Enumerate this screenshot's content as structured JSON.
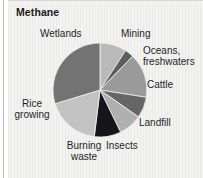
{
  "figure": {
    "title": "Methane",
    "background_color": "#f2f2f1"
  },
  "chart_data": {
    "type": "pie",
    "title": "Methane",
    "subtitle": "",
    "xlabel": "",
    "ylabel": "",
    "grid": false,
    "legend_position": "outside-labels",
    "units": "percent of methane emissions",
    "categories": [
      "Mining",
      "Oceans, freshwaters",
      "Cattle",
      "Landfill",
      "Insects",
      "Burning waste",
      "Rice growing",
      "Wetlands"
    ],
    "values": [
      9,
      3,
      15,
      7,
      8,
      9,
      18,
      31
    ],
    "slices": [
      {
        "label": "Mining",
        "value": 9,
        "start_angle": 0,
        "end_angle": 33,
        "color": "#b9b9b9"
      },
      {
        "label": "Oceans, freshwaters",
        "value": 3,
        "start_angle": 33,
        "end_angle": 44,
        "color": "#5d5d5d"
      },
      {
        "label": "Cattle",
        "value": 15,
        "start_angle": 44,
        "end_angle": 99,
        "color": "#9a9a9a"
      },
      {
        "label": "Landfill",
        "value": 7,
        "start_angle": 99,
        "end_angle": 125,
        "color": "#666666"
      },
      {
        "label": "Insects",
        "value": 8,
        "start_angle": 125,
        "end_angle": 154,
        "color": "#b0b0b0"
      },
      {
        "label": "Burning waste",
        "value": 9,
        "start_angle": 154,
        "end_angle": 187,
        "color": "#16161a"
      },
      {
        "label": "Rice growing",
        "value": 18,
        "start_angle": 187,
        "end_angle": 253,
        "color": "#c2c2c2"
      },
      {
        "label": "Wetlands",
        "value": 31,
        "start_angle": 253,
        "end_angle": 360,
        "color": "#737373"
      }
    ],
    "geometry": {
      "center_x": 48,
      "center_y": 48,
      "radius": 47
    }
  },
  "labels": {
    "wetlands": "Wetlands",
    "mining": "Mining",
    "oceans_line1": "Oceans,",
    "oceans_line2": "freshwaters",
    "cattle": "Cattle",
    "landfill": "Landfill",
    "insects": "Insects",
    "burning_line1": "Burning",
    "burning_line2": "waste",
    "rice_line1": "Rice",
    "rice_line2": "growing"
  }
}
